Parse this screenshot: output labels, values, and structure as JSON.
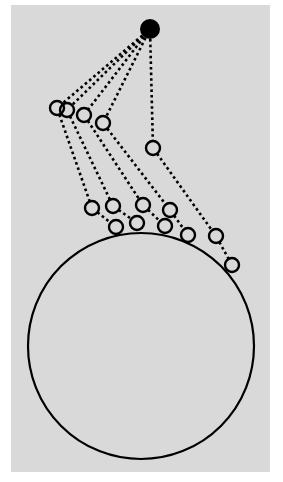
{
  "figure": {
    "background": "#d9d9d9",
    "page_background": "#ffffff",
    "stroke_color": "#000000",
    "source": {
      "name": "source-dot",
      "cx": 150,
      "cy": 29,
      "r": 10
    },
    "sphere": {
      "name": "large-sphere",
      "cx": 141,
      "cy": 346,
      "r": 113
    },
    "chains": [
      {
        "points": [
          [
            150,
            29
          ],
          [
            57,
            108
          ],
          [
            92,
            208
          ],
          [
            116,
            227
          ]
        ]
      },
      {
        "points": [
          [
            150,
            29
          ],
          [
            67,
            110
          ],
          [
            113,
            206
          ],
          [
            137,
            223
          ]
        ]
      },
      {
        "points": [
          [
            150,
            29
          ],
          [
            84,
            115
          ],
          [
            143,
            205
          ],
          [
            165,
            226
          ]
        ]
      },
      {
        "points": [
          [
            150,
            29
          ],
          [
            103,
            123
          ],
          [
            170,
            210
          ],
          [
            188,
            235
          ]
        ]
      },
      {
        "points": [
          [
            150,
            29
          ],
          [
            153,
            148
          ],
          [
            216,
            236
          ],
          [
            232,
            265
          ]
        ]
      }
    ],
    "node_radius": 7
  }
}
